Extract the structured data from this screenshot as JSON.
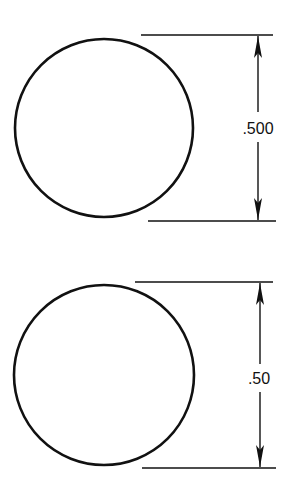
{
  "figures": [
    {
      "name": "circle-three-decimal",
      "circle": {
        "cx": 104,
        "cy": 128,
        "r": 89
      },
      "extension_top": {
        "x1": 141,
        "x2": 273,
        "y": 35
      },
      "extension_bottom": {
        "x1": 148,
        "x2": 276,
        "y": 221
      },
      "dimension_line": {
        "x": 258,
        "y1": 35,
        "y2": 221
      },
      "label": ".500",
      "label_pos": {
        "x": 258,
        "y": 134
      }
    },
    {
      "name": "circle-two-decimal",
      "circle": {
        "cx": 104,
        "cy": 375,
        "r": 90
      },
      "extension_top": {
        "x1": 135,
        "x2": 273,
        "y": 282
      },
      "extension_bottom": {
        "x1": 142,
        "x2": 276,
        "y": 468
      },
      "dimension_line": {
        "x": 260,
        "y1": 282,
        "y2": 468
      },
      "label": ".50",
      "label_pos": {
        "x": 259,
        "y": 384
      }
    }
  ],
  "colors": {
    "stroke": "#111111",
    "background": "#ffffff"
  }
}
